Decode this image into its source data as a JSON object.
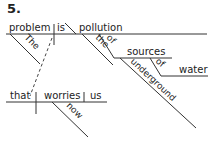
{
  "exercise_number": "5.",
  "diagram": {
    "type": "sentence-diagram",
    "main_clause": {
      "subject": "problem",
      "verb": "is",
      "predicate_nominative": "pollution",
      "subject_modifiers": [
        "The"
      ],
      "predicate_modifiers": [
        "the"
      ],
      "prepositional_phrase": {
        "preposition": "of",
        "object": "sources",
        "object_modifiers": [
          "underground"
        ],
        "nested_phrase": {
          "preposition": "of",
          "object": "water"
        }
      }
    },
    "relative_clause": {
      "subject": "that",
      "verb": "worries",
      "direct_object": "us",
      "verb_modifiers": [
        "now"
      ],
      "connector": "dashed line from 'that' to 'problem'"
    }
  },
  "words": {
    "problem": "problem",
    "is": "is",
    "pollution": "pollution",
    "the_cap": "The",
    "the": "the",
    "of1": "of",
    "sources": "sources",
    "of2": "of",
    "water": "water",
    "underground": "underground",
    "that": "that",
    "worries": "worries",
    "us": "us",
    "now": "now"
  }
}
